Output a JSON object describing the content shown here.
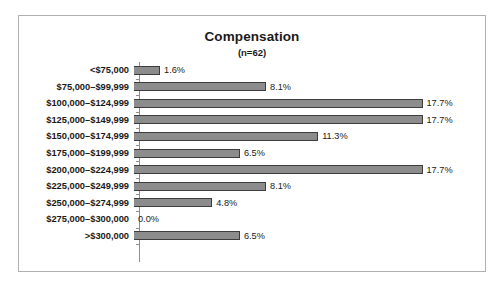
{
  "chart_data": {
    "type": "bar",
    "orientation": "horizontal",
    "title": "Compensation",
    "subtitle": "(n=62)",
    "xlabel": "",
    "ylabel": "",
    "grid": false,
    "legend": false,
    "xlim": [
      0,
      20
    ],
    "value_suffix": "%",
    "categories": [
      "<$75,000",
      "$75,000–$99,999",
      "$100,000–$124,999",
      "$125,000–$149,999",
      "$150,000–$174,999",
      "$175,000–$199,999",
      "$200,000–$224,999",
      "$225,000–$249,999",
      "$250,000–$274,999",
      "$275,000–$300,000",
      ">$300,000"
    ],
    "values": [
      1.6,
      8.1,
      17.7,
      17.7,
      11.3,
      6.5,
      17.7,
      8.1,
      4.8,
      0.0,
      6.5
    ],
    "data_labels": [
      "1.6%",
      "8.1%",
      "17.7%",
      "17.7%",
      "11.3%",
      "6.5%",
      "17.7%",
      "8.1%",
      "4.8%",
      "0.0%",
      "6.5%"
    ],
    "colors": {
      "bar_fill": "#8c8c8c",
      "bar_border": "#3d3d3d",
      "axis": "#8f8f8f",
      "frame_border": "#b0b0b0",
      "text": "#1a1a1a",
      "background": "#ffffff"
    }
  }
}
